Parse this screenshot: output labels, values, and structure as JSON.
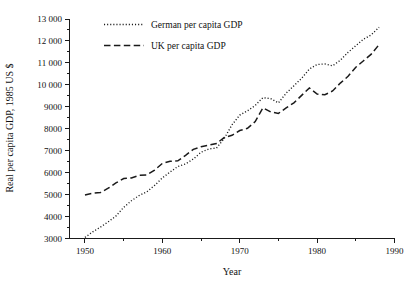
{
  "chart_data": {
    "type": "line",
    "title": "",
    "xlabel": "Year",
    "ylabel": "Real per capita GDP, 1985 US $",
    "xlim": [
      1948,
      1990
    ],
    "ylim": [
      3000,
      13000
    ],
    "grid": false,
    "legend_position": "top-left-inside",
    "x_ticks": [
      1950,
      1960,
      1970,
      1980,
      1990
    ],
    "x_tick_labels": [
      "1950",
      "1960",
      "1970",
      "1980",
      "1990"
    ],
    "x_minor_ticks": [
      1955,
      1965,
      1975,
      1985
    ],
    "y_ticks": [
      3000,
      4000,
      5000,
      6000,
      7000,
      8000,
      9000,
      10000,
      11000,
      12000,
      13000
    ],
    "y_tick_labels": [
      "3000",
      "4000",
      "5000",
      "6000",
      "7000",
      "8000",
      "9000",
      "10 000",
      "11 000",
      "12 000",
      "13 000"
    ],
    "x": [
      1950,
      1951,
      1952,
      1953,
      1954,
      1955,
      1956,
      1957,
      1958,
      1959,
      1960,
      1961,
      1962,
      1963,
      1964,
      1965,
      1966,
      1967,
      1968,
      1969,
      1970,
      1971,
      1972,
      1973,
      1974,
      1975,
      1976,
      1977,
      1978,
      1979,
      1980,
      1981,
      1982,
      1983,
      1984,
      1985,
      1986,
      1987,
      1988
    ],
    "series": [
      {
        "name": "German per capita GDP",
        "style": "dotted",
        "color": "#1a1a1a",
        "values": [
          3050,
          3300,
          3520,
          3760,
          4020,
          4420,
          4720,
          4960,
          5130,
          5420,
          5760,
          6030,
          6280,
          6400,
          6620,
          6930,
          7080,
          7120,
          7560,
          8180,
          8620,
          8820,
          9060,
          9420,
          9370,
          9180,
          9620,
          9960,
          10300,
          10720,
          10930,
          10950,
          10870,
          11120,
          11480,
          11780,
          12080,
          12280,
          12620
        ]
      },
      {
        "name": "UK per capita GDP",
        "style": "dashed",
        "color": "#1a1a1a",
        "values": [
          4980,
          5060,
          5090,
          5290,
          5530,
          5730,
          5760,
          5880,
          5900,
          6120,
          6420,
          6520,
          6540,
          6790,
          7060,
          7180,
          7250,
          7330,
          7600,
          7700,
          7920,
          8020,
          8330,
          8950,
          8770,
          8700,
          8950,
          9180,
          9520,
          9860,
          9580,
          9550,
          9720,
          10080,
          10390,
          10800,
          11100,
          11400,
          11830
        ]
      }
    ]
  },
  "legend": {
    "items": [
      {
        "label": "German per capita GDP",
        "marker": "dotted-line-icon"
      },
      {
        "label": "UK per capita GDP",
        "marker": "dashed-line-icon"
      }
    ]
  }
}
